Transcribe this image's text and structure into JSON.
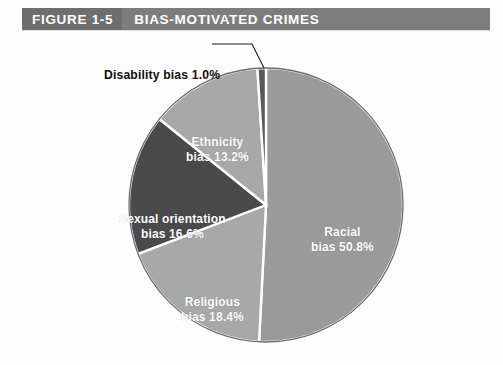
{
  "header": {
    "figure_number": "FIGURE 1-5",
    "title": "BIAS-MOTIVATED CRIMES",
    "bar_color": "#7d7d7d",
    "number_box_color": "#6e6e6e",
    "text_color": "#ffffff"
  },
  "callout": {
    "disability_label": "Disability bias 1.0%"
  },
  "labels": {
    "racial_line1": "Racial",
    "racial_line2": "bias 50.8%",
    "religious_line1": "Religious",
    "religious_line2": "bias 18.4%",
    "sexual_line1": "Sexual orientation",
    "sexual_line2": "bias 16.6%",
    "ethnicity_line1": "Ethnicity",
    "ethnicity_line2": "bias 13.2%"
  },
  "chart_data": {
    "type": "pie",
    "title": "BIAS-MOTIVATED CRIMES",
    "subtitle": "",
    "xlabel": "",
    "ylabel": "",
    "grid": false,
    "legend_position": "none",
    "labels_inside_slices": true,
    "start_angle_deg": 0,
    "direction": "clockwise",
    "center": {
      "x": 266,
      "y": 205
    },
    "radius": 137,
    "slice_border_color": "#ffffff",
    "outline_color": "#6b6b6b",
    "categories": [
      "Racial bias",
      "Religious bias",
      "Sexual orientation bias",
      "Ethnicity bias",
      "Disability bias"
    ],
    "values": [
      50.8,
      18.4,
      16.6,
      13.2,
      1.0
    ],
    "value_labels": [
      "50.8%",
      "18.4%",
      "16.6%",
      "13.2%",
      "1.0%"
    ],
    "units": "percent",
    "total": 100.0,
    "slices": [
      {
        "name": "Racial bias",
        "value": 50.8,
        "label": "50.8%",
        "color": "#9a9a9a",
        "start_deg": 0.0,
        "end_deg": 182.9
      },
      {
        "name": "Religious bias",
        "value": 18.4,
        "label": "18.4%",
        "color": "#a8a8a8",
        "start_deg": 182.9,
        "end_deg": 249.1
      },
      {
        "name": "Sexual orientation bias",
        "value": 16.6,
        "label": "16.6%",
        "color": "#4a4a4a",
        "start_deg": 249.1,
        "end_deg": 308.9
      },
      {
        "name": "Ethnicity bias",
        "value": 13.2,
        "label": "13.2%",
        "color": "#a8a8a8",
        "start_deg": 308.9,
        "end_deg": 356.4
      },
      {
        "name": "Disability bias",
        "value": 1.0,
        "label": "1.0%",
        "color": "#5a5a5a",
        "start_deg": 356.4,
        "end_deg": 360.0
      }
    ]
  }
}
